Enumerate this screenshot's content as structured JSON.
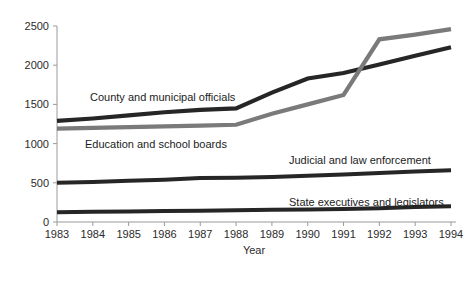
{
  "chart_data": {
    "type": "line",
    "title": "",
    "xlabel": "Year",
    "ylabel": "",
    "x": [
      1983,
      1984,
      1985,
      1986,
      1987,
      1988,
      1989,
      1990,
      1991,
      1992,
      1993,
      1994
    ],
    "categories": [
      "1983",
      "1984",
      "1985",
      "1986",
      "1987",
      "1988",
      "1989",
      "1990",
      "1991",
      "1992",
      "1993",
      "1994"
    ],
    "xlim": [
      1983,
      1994
    ],
    "ylim": [
      0,
      2500
    ],
    "yticks": [
      0,
      500,
      1000,
      1500,
      2000,
      2500
    ],
    "ytick_labels": [
      "0",
      "500",
      "1000",
      "1500",
      "2000",
      "2500"
    ],
    "grid": false,
    "legend": "inline-annotations",
    "series": [
      {
        "name": "County and municipal officials",
        "color": "#262626",
        "label_position": "above-line-left",
        "values": [
          1290,
          1320,
          1360,
          1400,
          1430,
          1450,
          1650,
          1830,
          1900,
          2010,
          2120,
          2230
        ]
      },
      {
        "name": "Education and school boards",
        "color": "#7a7a7a",
        "label_position": "below-line-left",
        "values": [
          1190,
          1200,
          1210,
          1220,
          1230,
          1240,
          1380,
          1500,
          1620,
          2330,
          2390,
          2460
        ]
      },
      {
        "name": "Judicial and law enforcement",
        "color": "#262626",
        "label_position": "above-line-right",
        "values": [
          500,
          510,
          525,
          540,
          560,
          565,
          575,
          590,
          605,
          625,
          645,
          660
        ]
      },
      {
        "name": "State executives and legislators",
        "color": "#262626",
        "label_position": "above-line-right",
        "values": [
          125,
          130,
          135,
          140,
          145,
          150,
          155,
          160,
          165,
          175,
          190,
          200
        ]
      }
    ]
  },
  "annotations": [
    {
      "text": "County and municipal officials",
      "x": 90,
      "y": 101
    },
    {
      "text": "Education and school boards",
      "x": 85,
      "y": 148
    },
    {
      "text": "Judicial and law enforcement",
      "x": 289,
      "y": 164
    },
    {
      "text": "State executives and legislators",
      "x": 289,
      "y": 206
    }
  ]
}
